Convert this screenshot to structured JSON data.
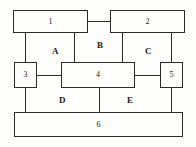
{
  "diagram": {
    "width": 196,
    "height": 147,
    "background_color": "#fdfdfc",
    "line_color": "#2b2b2b",
    "text_color": "#1a1a1a",
    "nodes": [
      {
        "id": "node-1",
        "label": "1",
        "x": 13,
        "y": 10,
        "w": 75,
        "h": 23
      },
      {
        "id": "node-2",
        "label": "2",
        "x": 110,
        "y": 10,
        "w": 75,
        "h": 23
      },
      {
        "id": "node-3",
        "label": "3",
        "x": 14,
        "y": 62,
        "w": 23,
        "h": 26
      },
      {
        "id": "node-4",
        "label": "4",
        "x": 61,
        "y": 62,
        "w": 74,
        "h": 26
      },
      {
        "id": "node-5",
        "label": "5",
        "x": 160,
        "y": 62,
        "w": 23,
        "h": 26
      },
      {
        "id": "node-6",
        "label": "6",
        "x": 14,
        "y": 112,
        "w": 169,
        "h": 25
      }
    ],
    "edges": [
      {
        "id": "edge-1-2",
        "orient": "h",
        "x": 88,
        "y": 21,
        "len": 22
      },
      {
        "id": "edge-1-3",
        "orient": "v",
        "x": 25,
        "y": 33,
        "len": 29
      },
      {
        "id": "edge-1-4",
        "orient": "v",
        "x": 74,
        "y": 33,
        "len": 29
      },
      {
        "id": "edge-2-4",
        "orient": "v",
        "x": 122,
        "y": 33,
        "len": 29
      },
      {
        "id": "edge-2-5",
        "orient": "v",
        "x": 171,
        "y": 33,
        "len": 29
      },
      {
        "id": "edge-3-4",
        "orient": "h",
        "x": 37,
        "y": 75,
        "len": 24
      },
      {
        "id": "edge-4-5",
        "orient": "h",
        "x": 135,
        "y": 75,
        "len": 25
      },
      {
        "id": "edge-3-6",
        "orient": "v",
        "x": 25,
        "y": 88,
        "len": 24
      },
      {
        "id": "edge-4-6",
        "orient": "v",
        "x": 99,
        "y": 88,
        "len": 24
      },
      {
        "id": "edge-5-6",
        "orient": "v",
        "x": 171,
        "y": 88,
        "len": 24
      }
    ],
    "region_labels": [
      {
        "id": "region-a",
        "label": "A",
        "x": 52,
        "y": 47
      },
      {
        "id": "region-b",
        "label": "B",
        "x": 97,
        "y": 41
      },
      {
        "id": "region-c",
        "label": "C",
        "x": 145,
        "y": 47
      },
      {
        "id": "region-d",
        "label": "D",
        "x": 59,
        "y": 96
      },
      {
        "id": "region-e",
        "label": "E",
        "x": 127,
        "y": 96
      }
    ]
  }
}
